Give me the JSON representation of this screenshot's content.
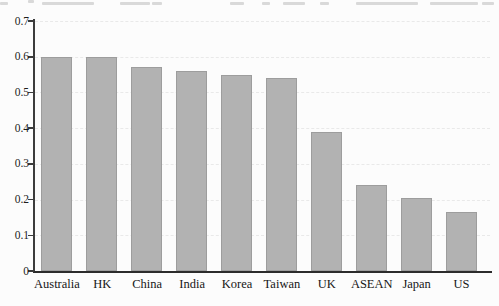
{
  "page": {
    "background": "#fcfcfc",
    "top_edge_note": "partially cropped caption text (unreadable fragments)"
  },
  "chart_data": {
    "type": "bar",
    "categories": [
      "Australia",
      "HK",
      "China",
      "India",
      "Korea",
      "Taiwan",
      "UK",
      "ASEAN",
      "Japan",
      "US"
    ],
    "values": [
      0.6,
      0.6,
      0.57,
      0.56,
      0.55,
      0.54,
      0.39,
      0.24,
      0.205,
      0.165
    ],
    "title": "",
    "xlabel": "",
    "ylabel": "",
    "ylim": [
      0,
      0.7
    ],
    "ytick_step": 0.1,
    "ytick_labels": [
      "0",
      "0.1",
      "0.2",
      "0.3",
      "0.4",
      "0.5",
      "0.6",
      "0.7"
    ],
    "grid": "faint dashed horizontal gridlines at each 0.1",
    "legend": "none",
    "bar_color": "#b2b2b2",
    "axis_color": "#2c2c2c",
    "gridline_color": "#e9e9e9"
  }
}
